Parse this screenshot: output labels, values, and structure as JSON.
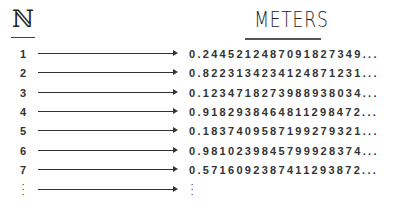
{
  "headers": {
    "left": "ℕ",
    "right": "METERS"
  },
  "rows": [
    {
      "n": "1",
      "value": "0.2445212487091827349..."
    },
    {
      "n": "2",
      "value": "0.8223134234124871231..."
    },
    {
      "n": "3",
      "value": "0.1234718273988938034..."
    },
    {
      "n": "4",
      "value": "0.9182938464811298472..."
    },
    {
      "n": "5",
      "value": "0.1837409587199279321..."
    },
    {
      "n": "6",
      "value": "0.9810239845799928374..."
    },
    {
      "n": "7",
      "value": "0.5716092387411293872..."
    }
  ],
  "continuation": {
    "left": "⋮",
    "right": "⋮"
  },
  "colors": {
    "text": "#333333",
    "background": "#ffffff"
  }
}
